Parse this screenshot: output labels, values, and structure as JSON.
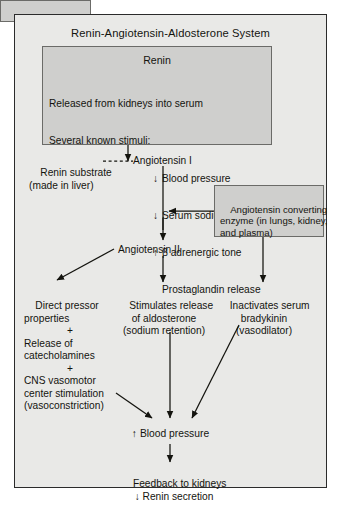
{
  "figure": {
    "title": "Renin-Angiotensin-Aldosterone System",
    "colors": {
      "panel_background": "#e9e9e7",
      "panel_border": "#2b2b2b",
      "box_fill": "#cfcfcd",
      "box_border": "#6b6b68",
      "text": "#14140f"
    }
  },
  "renin_box": {
    "heading": "Renin",
    "line1": "Released from kidneys into serum",
    "line2": "Several known stimuli:",
    "stimuli": [
      {
        "arrow": "↓",
        "label": "Blood pressure"
      },
      {
        "arrow": "↓",
        "label": "Serum sodium"
      },
      {
        "arrow": "↑",
        "label": "β adrenergic tone"
      },
      {
        "arrow": "",
        "label": "Prostaglandin release"
      }
    ]
  },
  "substrate": {
    "line1": "Renin substrate",
    "line2": "(made in liver)"
  },
  "angiotensin_i": "Angiotensin I",
  "ace_box": {
    "line1": "Angiotensin converting",
    "line2": "enzyme (in lungs, kidney,",
    "line3": "and plasma)"
  },
  "angiotensin_ii": "Angiotensin II",
  "effects": {
    "left": {
      "item1_line1": "Direct pressor",
      "item1_line2": "properties",
      "plus1": "+",
      "item2_line1": "Release of",
      "item2_line2": "catecholamines",
      "plus2": "+",
      "item3_line1": "CNS vasomotor",
      "item3_line2": "center stimulation",
      "item3_line3": "(vasoconstriction)"
    },
    "middle": {
      "line1": "Stimulates release",
      "line2": "of aldosterone",
      "line3": "(sodium retention)"
    },
    "right": {
      "line1": "Inactivates serum",
      "line2": "bradykinin",
      "line3": "(vasodilator)"
    }
  },
  "blood_pressure": {
    "arrow": "↑",
    "label": "Blood pressure"
  },
  "feedback": {
    "line1": "Feedback to kidneys",
    "arrow": "↓",
    "line2": "Renin secretion"
  }
}
